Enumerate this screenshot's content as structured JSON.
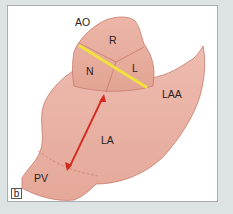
{
  "figure": {
    "panel_label": "b",
    "labels": {
      "aorta": "AO",
      "right_cusp": "R",
      "noncoronary_cusp": "N",
      "left_cusp": "L",
      "left_atrial_appendage": "LAA",
      "left_atrium": "LA",
      "pulmonary_veins": "PV"
    },
    "colors": {
      "background": "#dde2e2",
      "panel": "#ffffff",
      "tissue_fill": "#e9b3a6",
      "tissue_outline": "#c9786c",
      "valve_fill": "#e6ab9e",
      "measurement_yellow": "#f2e13a",
      "measurement_red": "#d42a1e",
      "dashed_boundary": "#c9786c"
    },
    "annotations": [
      {
        "type": "line",
        "color": "yellow",
        "description": "aortic valve annulus diameter line across N and L cusps"
      },
      {
        "type": "double-arrow",
        "color": "red",
        "description": "left atrial anteroposterior dimension from aortic root to pulmonary vein region"
      },
      {
        "type": "dashed-line",
        "description": "boundary between LA and PV"
      }
    ]
  }
}
